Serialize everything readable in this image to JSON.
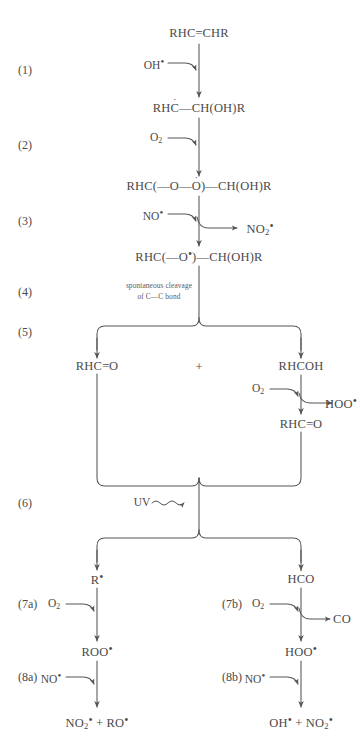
{
  "diagram": {
    "type": "reaction-scheme"
  },
  "steps": [
    {
      "id": "s1",
      "label": "(1)"
    },
    {
      "id": "s2",
      "label": "(2)"
    },
    {
      "id": "s3",
      "label": "(3)"
    },
    {
      "id": "s4",
      "label": "(4)"
    },
    {
      "id": "s5",
      "label": "(5)"
    },
    {
      "id": "s6",
      "label": "(6)"
    },
    {
      "id": "s7a",
      "label": "(7a)"
    },
    {
      "id": "s7b",
      "label": "(7b)"
    },
    {
      "id": "s8a",
      "label": "(8a)"
    },
    {
      "id": "s8b",
      "label": "(8b)"
    }
  ],
  "species": {
    "alkene": "RHC=CHR",
    "carbon_radical": "RHĊ—CH(OH)R",
    "peroxy": "RHC(—O—Ȯ)—CH(OH)R",
    "alkoxy": "RHC(—O•)—CH(OH)R",
    "aldehyde_left": "RHC=O",
    "plus": "+",
    "hydroxyalkyl_radical": "RHĊOH",
    "aldehyde_right": "RHC=O",
    "alkyl_radical": "R•",
    "formyl_radical": "HĊO",
    "peroxy_alkyl": "ROO•",
    "hydroperoxyl": "HOO•",
    "products_left": "NO₂• + RO•",
    "products_right": "OH• + NO₂•"
  },
  "reagents": {
    "hydroxyl": "OH•",
    "oxygen_1": "O₂",
    "nitric_oxide_3": "NO•",
    "oxygen_5": "O₂",
    "oxygen_7a": "O₂",
    "oxygen_7b": "O₂",
    "nitric_oxide_8a": "NO•",
    "nitric_oxide_8b": "NO•"
  },
  "byproducts": {
    "nitrogen_dioxide_3": "NO₂•",
    "hydroperoxyl_5": "HOO•",
    "carbon_monoxide_7b": "CO"
  },
  "annotations": {
    "cleavage_line1": "spontaneous cleavage",
    "cleavage_line2": "of C—C bond",
    "uv": "UV"
  },
  "colors": {
    "ink": "#4a4a4a",
    "line": "#555555",
    "background": "#ffffff"
  }
}
